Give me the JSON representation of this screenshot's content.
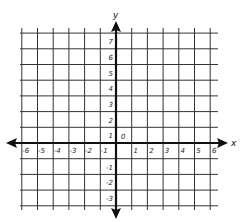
{
  "diagram": {
    "type": "coordinate-plane",
    "x_axis": {
      "label": "x",
      "min": -6,
      "max": 6,
      "tick_labels": [
        "-6",
        "-5",
        "-4",
        "-3",
        "-2",
        "-1",
        "1",
        "2",
        "3",
        "4",
        "5",
        "6"
      ]
    },
    "y_axis": {
      "label": "y",
      "min": -3,
      "max": 7,
      "tick_labels": [
        "7",
        "6",
        "5",
        "4",
        "3",
        "2",
        "1",
        "-1",
        "-2",
        "-3"
      ]
    },
    "origin_label": "0",
    "colors": {
      "grid": "#333333",
      "axis": "#111111",
      "background": "#ffffff"
    }
  }
}
